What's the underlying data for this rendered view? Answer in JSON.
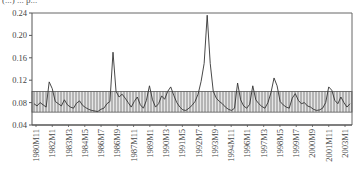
{
  "chart_data": {
    "type": "line",
    "title": "",
    "title_fragment_top": "(...) ... p...",
    "xlabel": "",
    "ylabel": "",
    "ylim": [
      0.04,
      0.24
    ],
    "yticks": [
      "0.04",
      "0.08",
      "0.12",
      "0.16",
      "0.20",
      "0.24"
    ],
    "xticks": [
      "1980M11",
      "1982M1",
      "1983M3",
      "1984M5",
      "1986M7",
      "1986M9",
      "1987M11",
      "1989M1",
      "1990M3",
      "1991M5",
      "1992M7",
      "1993M9",
      "1994M11",
      "1996M1",
      "1997M3",
      "1998M5",
      "1999M7",
      "2000M9",
      "2001M11",
      "2003M1"
    ],
    "grid": false,
    "legend": null,
    "band": {
      "lower": 0.063,
      "upper": 0.1,
      "style": "vertical-hatched",
      "color": "#555555"
    },
    "series": [
      {
        "name": "series",
        "color": "#333333",
        "values": [
          0.078,
          0.074,
          0.08,
          0.076,
          0.072,
          0.117,
          0.105,
          0.082,
          0.078,
          0.074,
          0.085,
          0.076,
          0.072,
          0.07,
          0.079,
          0.083,
          0.075,
          0.071,
          0.068,
          0.066,
          0.065,
          0.064,
          0.068,
          0.07,
          0.078,
          0.082,
          0.17,
          0.1,
          0.09,
          0.095,
          0.088,
          0.08,
          0.072,
          0.082,
          0.09,
          0.076,
          0.07,
          0.084,
          0.11,
          0.085,
          0.072,
          0.078,
          0.092,
          0.086,
          0.1,
          0.108,
          0.093,
          0.08,
          0.072,
          0.067,
          0.066,
          0.07,
          0.075,
          0.082,
          0.095,
          0.118,
          0.15,
          0.236,
          0.15,
          0.1,
          0.088,
          0.082,
          0.078,
          0.072,
          0.068,
          0.066,
          0.07,
          0.115,
          0.085,
          0.074,
          0.07,
          0.077,
          0.11,
          0.085,
          0.078,
          0.073,
          0.07,
          0.08,
          0.098,
          0.124,
          0.11,
          0.082,
          0.076,
          0.072,
          0.07,
          0.088,
          0.096,
          0.084,
          0.078,
          0.08,
          0.074,
          0.072,
          0.068,
          0.066,
          0.067,
          0.07,
          0.08,
          0.108,
          0.102,
          0.084,
          0.078,
          0.09,
          0.08,
          0.072,
          0.078
        ]
      }
    ]
  },
  "layout": {
    "plot_left": 32,
    "plot_right": 352,
    "plot_top": 13,
    "plot_bottom": 125,
    "series_x_start": 34,
    "series_x_end": 350,
    "xtick_x_start": 36,
    "xtick_x_end": 345,
    "label_top": 129
  }
}
